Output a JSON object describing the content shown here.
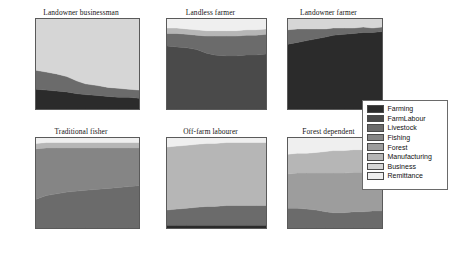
{
  "figure": {
    "title": "",
    "panel_layout": {
      "rows": 2,
      "cols": 3
    }
  },
  "axes": {
    "y_ticks": [
      "0",
      "20",
      "40",
      "60",
      "80",
      "100"
    ],
    "x_ticks": [
      "2000",
      "2024",
      "2050"
    ],
    "ylabel": "",
    "xlabel": ""
  },
  "legend": {
    "position": "right-middle",
    "entries": [
      {
        "label": "Farming",
        "color": "#2b2b2b"
      },
      {
        "label": "FarmLabour",
        "color": "#4a4a4a"
      },
      {
        "label": "Livestock",
        "color": "#6b6b6b"
      },
      {
        "label": "Fishing",
        "color": "#858585"
      },
      {
        "label": "Forest",
        "color": "#9d9d9d"
      },
      {
        "label": "Manufacturing",
        "color": "#b6b6b6"
      },
      {
        "label": "Business",
        "color": "#d6d6d6"
      },
      {
        "label": "Remittance",
        "color": "#efefef"
      }
    ]
  },
  "chart_data": {
    "type": "area",
    "title": "",
    "xlabel": "",
    "ylabel": "",
    "xlim": [
      2000,
      2050
    ],
    "ylim": [
      0,
      100
    ],
    "grid": false,
    "stacked": true,
    "normalized_percent": true,
    "x_ticks": [
      2000,
      2024,
      2050
    ],
    "y_ticks": [
      0,
      20,
      40,
      60,
      80,
      100
    ],
    "legend_position": "right",
    "series_names": [
      "Farming",
      "FarmLabour",
      "Livestock",
      "Fishing",
      "Forest",
      "Manufacturing",
      "Business",
      "Remittance"
    ],
    "series_colors": [
      "#2b2b2b",
      "#4a4a4a",
      "#6b6b6b",
      "#858585",
      "#9d9d9d",
      "#b6b6b6",
      "#d6d6d6",
      "#efefef"
    ],
    "panels": [
      {
        "title": "Landowner businessman",
        "x": [
          2000,
          2005,
          2010,
          2015,
          2020,
          2024,
          2030,
          2035,
          2040,
          2045,
          2050
        ],
        "series": [
          {
            "name": "Farming",
            "values": [
              22,
              21,
              20,
              19,
              17,
              16,
              15,
              14,
              13,
              13,
              12
            ]
          },
          {
            "name": "FarmLabour",
            "values": [
              0,
              0,
              0,
              0,
              0,
              0,
              0,
              0,
              0,
              0,
              0
            ]
          },
          {
            "name": "Livestock",
            "values": [
              21,
              20,
              19,
              17,
              14,
              12,
              11,
              10,
              10,
              9,
              9
            ]
          },
          {
            "name": "Fishing",
            "values": [
              0,
              0,
              0,
              0,
              0,
              0,
              0,
              0,
              0,
              0,
              0
            ]
          },
          {
            "name": "Forest",
            "values": [
              0,
              0,
              0,
              0,
              0,
              0,
              0,
              0,
              0,
              0,
              0
            ]
          },
          {
            "name": "Manufacturing",
            "values": [
              0,
              0,
              0,
              0,
              0,
              0,
              0,
              0,
              0,
              0,
              0
            ]
          },
          {
            "name": "Business",
            "values": [
              57,
              59,
              61,
              64,
              69,
              72,
              74,
              76,
              77,
              78,
              79
            ]
          },
          {
            "name": "Remittance",
            "values": [
              0,
              0,
              0,
              0,
              0,
              0,
              0,
              0,
              0,
              0,
              0
            ]
          }
        ]
      },
      {
        "title": "Landless farmer",
        "x": [
          2000,
          2005,
          2010,
          2015,
          2020,
          2024,
          2030,
          2035,
          2040,
          2045,
          2050
        ],
        "series": [
          {
            "name": "Farming",
            "values": [
              0,
              0,
              0,
              0,
              0,
              0,
              0,
              0,
              0,
              0,
              0
            ]
          },
          {
            "name": "FarmLabour",
            "values": [
              70,
              69,
              68,
              66,
              62,
              60,
              59,
              59,
              60,
              60,
              61
            ]
          },
          {
            "name": "Livestock",
            "values": [
              14,
              15,
              15,
              16,
              19,
              21,
              22,
              22,
              22,
              22,
              22
            ]
          },
          {
            "name": "Fishing",
            "values": [
              0,
              0,
              0,
              0,
              0,
              0,
              0,
              0,
              0,
              0,
              0
            ]
          },
          {
            "name": "Forest",
            "values": [
              0,
              0,
              0,
              0,
              0,
              0,
              0,
              0,
              0,
              0,
              0
            ]
          },
          {
            "name": "Manufacturing",
            "values": [
              6,
              6,
              6,
              6,
              6,
              6,
              6,
              6,
              6,
              6,
              6
            ]
          },
          {
            "name": "Business",
            "values": [
              0,
              0,
              0,
              0,
              0,
              0,
              0,
              0,
              0,
              0,
              0
            ]
          },
          {
            "name": "Remittance",
            "values": [
              10,
              10,
              11,
              12,
              13,
              13,
              13,
              13,
              12,
              12,
              11
            ]
          }
        ]
      },
      {
        "title": "Landowner farmer",
        "x": [
          2000,
          2005,
          2010,
          2015,
          2020,
          2024,
          2030,
          2035,
          2040,
          2045,
          2050
        ],
        "series": [
          {
            "name": "Farming",
            "values": [
              72,
              74,
              76,
              78,
              80,
              82,
              83,
              84,
              85,
              85,
              86
            ]
          },
          {
            "name": "FarmLabour",
            "values": [
              0,
              0,
              0,
              0,
              0,
              0,
              0,
              0,
              0,
              0,
              0
            ]
          },
          {
            "name": "Livestock",
            "values": [
              16,
              15,
              13,
              11,
              9,
              8,
              7,
              6,
              6,
              5,
              5
            ]
          },
          {
            "name": "Fishing",
            "values": [
              0,
              0,
              0,
              0,
              0,
              0,
              0,
              0,
              0,
              0,
              0
            ]
          },
          {
            "name": "Forest",
            "values": [
              0,
              0,
              0,
              0,
              0,
              0,
              0,
              0,
              0,
              0,
              0
            ]
          },
          {
            "name": "Manufacturing",
            "values": [
              0,
              0,
              0,
              0,
              0,
              0,
              0,
              0,
              0,
              0,
              0
            ]
          },
          {
            "name": "Business",
            "values": [
              12,
              11,
              11,
              11,
              11,
              10,
              10,
              10,
              9,
              10,
              9
            ]
          },
          {
            "name": "Remittance",
            "values": [
              0,
              0,
              0,
              0,
              0,
              0,
              0,
              0,
              0,
              0,
              0
            ]
          }
        ]
      },
      {
        "title": "Traditional fisher",
        "x": [
          2000,
          2005,
          2010,
          2015,
          2020,
          2024,
          2030,
          2035,
          2040,
          2045,
          2050
        ],
        "series": [
          {
            "name": "Farming",
            "values": [
              0,
              0,
              0,
              0,
              0,
              0,
              0,
              0,
              0,
              0,
              0
            ]
          },
          {
            "name": "FarmLabour",
            "values": [
              0,
              0,
              0,
              0,
              0,
              0,
              0,
              0,
              0,
              0,
              0
            ]
          },
          {
            "name": "Livestock",
            "values": [
              32,
              36,
              38,
              40,
              41,
              42,
              43,
              44,
              45,
              46,
              47
            ]
          },
          {
            "name": "Fishing",
            "values": [
              56,
              53,
              51,
              49,
              48,
              47,
              46,
              45,
              44,
              43,
              42
            ]
          },
          {
            "name": "Forest",
            "values": [
              0,
              0,
              0,
              0,
              0,
              0,
              0,
              0,
              0,
              0,
              0
            ]
          },
          {
            "name": "Manufacturing",
            "values": [
              6,
              6,
              6,
              6,
              6,
              6,
              6,
              6,
              6,
              6,
              6
            ]
          },
          {
            "name": "Business",
            "values": [
              0,
              0,
              0,
              0,
              0,
              0,
              0,
              0,
              0,
              0,
              0
            ]
          },
          {
            "name": "Remittance",
            "values": [
              6,
              5,
              5,
              5,
              5,
              5,
              5,
              5,
              5,
              5,
              5
            ]
          }
        ]
      },
      {
        "title": "Off-farm labourer",
        "x": [
          2000,
          2005,
          2010,
          2015,
          2020,
          2024,
          2030,
          2035,
          2040,
          2045,
          2050
        ],
        "series": [
          {
            "name": "Farming",
            "values": [
              3,
              3,
              3,
              3,
              3,
              3,
              3,
              3,
              3,
              3,
              3
            ]
          },
          {
            "name": "FarmLabour",
            "values": [
              0,
              0,
              0,
              0,
              0,
              0,
              0,
              0,
              0,
              0,
              0
            ]
          },
          {
            "name": "Livestock",
            "values": [
              17,
              18,
              19,
              20,
              21,
              21,
              22,
              22,
              22,
              22,
              22
            ]
          },
          {
            "name": "Fishing",
            "values": [
              0,
              0,
              0,
              0,
              0,
              0,
              0,
              0,
              0,
              0,
              0
            ]
          },
          {
            "name": "Forest",
            "values": [
              0,
              0,
              0,
              0,
              0,
              0,
              0,
              0,
              0,
              0,
              0
            ]
          },
          {
            "name": "Manufacturing",
            "values": [
              70,
              70,
              70,
              70,
              70,
              70,
              70,
              70,
              70,
              70,
              70
            ]
          },
          {
            "name": "Business",
            "values": [
              0,
              0,
              0,
              0,
              0,
              0,
              0,
              0,
              0,
              0,
              0
            ]
          },
          {
            "name": "Remittance",
            "values": [
              10,
              9,
              8,
              7,
              6,
              6,
              5,
              5,
              5,
              5,
              5
            ]
          }
        ]
      },
      {
        "title": "Forest dependent",
        "x": [
          2000,
          2005,
          2010,
          2015,
          2020,
          2024,
          2030,
          2035,
          2040,
          2045,
          2050
        ],
        "series": [
          {
            "name": "Farming",
            "values": [
              0,
              0,
              0,
              0,
              0,
              0,
              0,
              0,
              0,
              0,
              0
            ]
          },
          {
            "name": "FarmLabour",
            "values": [
              0,
              0,
              0,
              0,
              0,
              0,
              0,
              0,
              0,
              0,
              0
            ]
          },
          {
            "name": "Livestock",
            "values": [
              22,
              22,
              21,
              20,
              18,
              17,
              17,
              18,
              18,
              19,
              19
            ]
          },
          {
            "name": "Fishing",
            "values": [
              0,
              0,
              0,
              0,
              0,
              0,
              0,
              0,
              0,
              0,
              0
            ]
          },
          {
            "name": "Forest",
            "values": [
              38,
              39,
              40,
              41,
              43,
              44,
              44,
              44,
              44,
              44,
              44
            ]
          },
          {
            "name": "Manufacturing",
            "values": [
              22,
              22,
              22,
              23,
              24,
              25,
              25,
              25,
              25,
              25,
              25
            ]
          },
          {
            "name": "Business",
            "values": [
              0,
              0,
              0,
              0,
              0,
              0,
              0,
              0,
              0,
              0,
              0
            ]
          },
          {
            "name": "Remittance",
            "values": [
              18,
              17,
              17,
              16,
              15,
              14,
              14,
              13,
              13,
              12,
              12
            ]
          }
        ]
      }
    ]
  }
}
